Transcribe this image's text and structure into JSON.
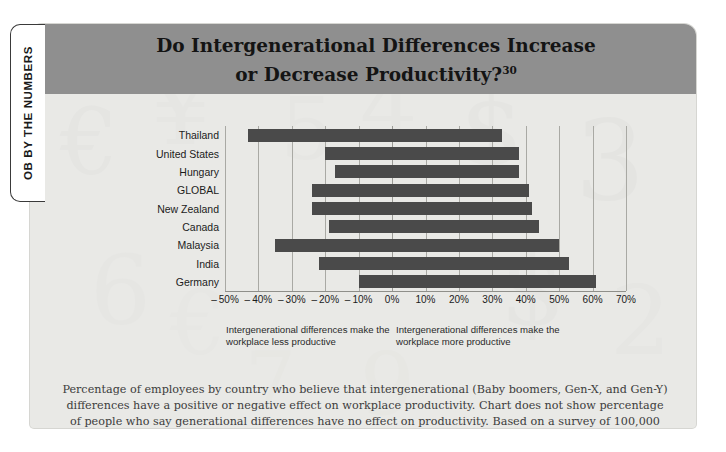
{
  "side_tab": {
    "label": "OB BY THE NUMBERS"
  },
  "header": {
    "title_line1": "Do Intergenerational Differences Increase",
    "title_line2": "or Decrease Productivity?",
    "footnote_marker": "30"
  },
  "notes": {
    "left": "Intergenerational differences make the workplace less productive",
    "right": "Intergenerational differences make the workplace more productive"
  },
  "caption": "Percentage of employees by country who believe that intergenerational (Baby boomers, Gen-X, and Gen-Y) differences have a positive or negative effect on workplace productivity. Chart does not show percentage of people who say generational differences have no effect on productivity. Based on a survey of 100,000 employees in 33 countries.",
  "colors": {
    "bar": "#4a4a4a",
    "header_band": "#8f8f8f",
    "panel_background": "#e9e9e6",
    "gridline": "#a9a9a4",
    "text": "#1b1b1b"
  },
  "chart_data": {
    "type": "bar",
    "orientation": "horizontal",
    "title": "Do Intergenerational Differences Increase or Decrease Productivity?",
    "xlabel": "",
    "ylabel": "",
    "xlim": [
      -50,
      70
    ],
    "xtick_step": 10,
    "xticks": [
      "-50%",
      "-40%",
      "-30%",
      "-20%",
      "-10%",
      "0%",
      "10%",
      "20%",
      "30%",
      "40%",
      "50%",
      "60%",
      "70%"
    ],
    "xtick_values": [
      -50,
      -40,
      -30,
      -20,
      -10,
      0,
      10,
      20,
      30,
      40,
      50,
      60,
      70
    ],
    "grid": true,
    "legend": "none",
    "categories": [
      "Thailand",
      "United States",
      "Hungary",
      "GLOBAL",
      "New Zealand",
      "Canada",
      "Malaysia",
      "India",
      "Germany"
    ],
    "series": [
      {
        "name": "Makes workplace less productive",
        "values": [
          -43,
          -20,
          -17,
          -24,
          -24,
          -19,
          -35,
          -22,
          -10
        ]
      },
      {
        "name": "Makes workplace more productive",
        "values": [
          33,
          38,
          38,
          41,
          42,
          44,
          50,
          53,
          61
        ]
      }
    ]
  }
}
